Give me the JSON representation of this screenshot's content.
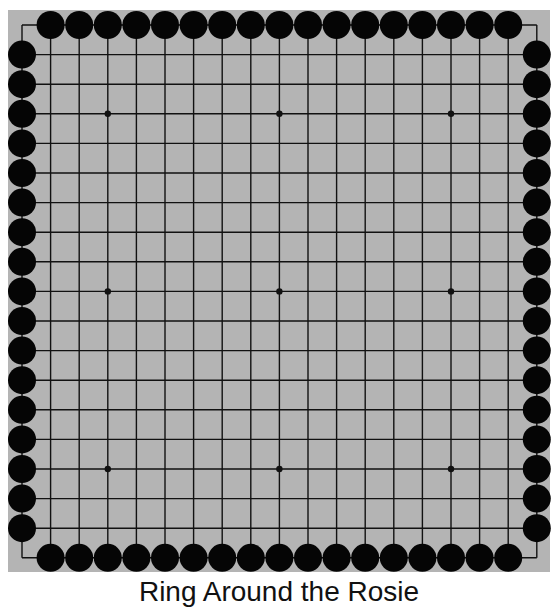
{
  "board": {
    "size": 19,
    "background_color": "#b4b4b4",
    "line_color": "#111111",
    "stone_color": "#050505",
    "origin": {
      "x": 22,
      "y": 25
    },
    "spacing": {
      "x": 28.6,
      "y": 29.6
    },
    "rect": {
      "x": 8,
      "y": 10,
      "w": 542,
      "h": 562
    },
    "stone_radius": 14,
    "star_points": [
      [
        3,
        3
      ],
      [
        9,
        3
      ],
      [
        15,
        3
      ],
      [
        3,
        9
      ],
      [
        9,
        9
      ],
      [
        15,
        9
      ],
      [
        3,
        15
      ],
      [
        9,
        15
      ],
      [
        15,
        15
      ]
    ],
    "stones_description": "Black stones on every edge point except the four corners",
    "stones": {
      "color": "black",
      "top_row": {
        "y": 0,
        "x_from": 1,
        "x_to": 17
      },
      "bottom_row": {
        "y": 18,
        "x_from": 1,
        "x_to": 17
      },
      "left_col": {
        "x": 0,
        "y_from": 1,
        "y_to": 17
      },
      "right_col": {
        "x": 18,
        "y_from": 1,
        "y_to": 17
      }
    },
    "stone_count": 68
  },
  "caption": "Ring Around the Rosie"
}
